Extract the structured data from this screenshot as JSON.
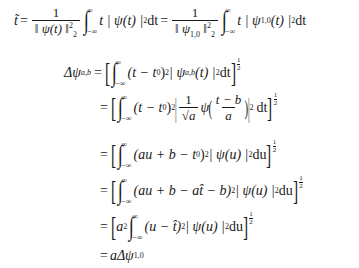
{
  "document": {
    "title": "Wavelet time-center and time-width derivation",
    "line1": {
      "lhs": "t̃",
      "eq": "=",
      "frac1_num": "1",
      "frac1_den": "‖ ψ(t) ‖",
      "frac1_den_sub": "2",
      "frac1_den_sup": "2",
      "int_upper": "∞",
      "int_lower": "−∞",
      "integrand1": "t | ψ(t) |",
      "integrand1_sup": "2",
      "d1": "dt",
      "eq2": "=",
      "frac2_num": "1",
      "frac2_den": "‖ ψ",
      "frac2_den_sub": "1,0",
      "frac2_den_tail": " ‖",
      "integrand2_a": "t | ψ",
      "integrand2_sub": "1,0",
      "integrand2_b": "(t) |",
      "integrand2_sup": "2",
      "d2": "dt"
    },
    "line2": {
      "lhs": "Δψ",
      "lhs_sub": "a,b",
      "eq": "=",
      "integrand": "(t − t",
      "integrand_sup0": "0",
      "integrand_b": ")",
      "integrand_sup2": "2",
      "integrand_c": " | ψ",
      "integrand_sub": "a,b",
      "integrand_d": "(t) |",
      "integrand_sup3": "2",
      "d": "dt"
    },
    "line3": {
      "eq": "=",
      "integrand": "(t − t",
      "sup0": "0",
      "b": ")",
      "sup2": "2",
      "frac_num": "1",
      "frac_den": "√a",
      "psi": "ψ",
      "arg_num": "t − b",
      "arg_den": "a",
      "sup_abs": "2",
      "d": "dt"
    },
    "line4": {
      "eq": "=",
      "integrand": "(au + b − t",
      "sup0": "0",
      "b": ")",
      "sup2": "2",
      "c": " | ψ(u) |",
      "sup3": "2",
      "d": "du"
    },
    "line5": {
      "eq": "=",
      "integrand": "(au + b − at̂ − b)",
      "sup2": "2",
      "c": " | ψ(u) |",
      "sup3": "2",
      "d": "du"
    },
    "line6": {
      "eq": "=",
      "a": "a",
      "a_sup": "2",
      "integrand": "(u − t̂)",
      "sup2": "2",
      "c": " | ψ(u) |",
      "sup3": "2",
      "d": "du"
    },
    "line7": {
      "eq": "=",
      "expr": "aΔψ",
      "sub": "1,0"
    },
    "exponent_half_num": "1",
    "exponent_half_den": "2",
    "int_upper": "∞",
    "int_lower": "−∞"
  }
}
